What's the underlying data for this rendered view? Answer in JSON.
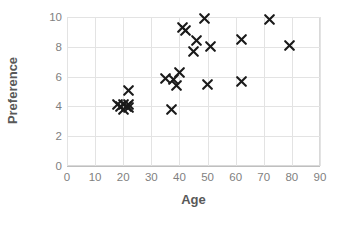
{
  "chart_data": {
    "type": "scatter",
    "title": "",
    "xlabel": "Age",
    "ylabel": "Preference",
    "xlim": [
      0,
      90
    ],
    "ylim": [
      0,
      10
    ],
    "xticks": [
      0,
      10,
      20,
      30,
      40,
      50,
      60,
      70,
      80,
      90
    ],
    "yticks": [
      0,
      2,
      4,
      6,
      8,
      10
    ],
    "grid": true,
    "legend": "none",
    "marker": "x-cross",
    "marker_color": "#1a1a1a",
    "series": [
      {
        "name": "Preference vs Age",
        "points": [
          {
            "x": 18,
            "y": 4.1
          },
          {
            "x": 19,
            "y": 4.0
          },
          {
            "x": 20,
            "y": 4.1
          },
          {
            "x": 20,
            "y": 3.8
          },
          {
            "x": 21,
            "y": 4.0
          },
          {
            "x": 22,
            "y": 4.1
          },
          {
            "x": 22,
            "y": 5.1
          },
          {
            "x": 22,
            "y": 3.9
          },
          {
            "x": 35,
            "y": 5.9
          },
          {
            "x": 37,
            "y": 3.8
          },
          {
            "x": 38,
            "y": 5.8
          },
          {
            "x": 39,
            "y": 5.4
          },
          {
            "x": 40,
            "y": 6.3
          },
          {
            "x": 41,
            "y": 9.3
          },
          {
            "x": 42,
            "y": 9.1
          },
          {
            "x": 45,
            "y": 7.7
          },
          {
            "x": 46,
            "y": 8.4
          },
          {
            "x": 49,
            "y": 9.9
          },
          {
            "x": 51,
            "y": 8.0
          },
          {
            "x": 50,
            "y": 5.5
          },
          {
            "x": 62,
            "y": 8.5
          },
          {
            "x": 62,
            "y": 5.7
          },
          {
            "x": 72,
            "y": 9.8
          },
          {
            "x": 79,
            "y": 8.1
          }
        ]
      }
    ]
  }
}
